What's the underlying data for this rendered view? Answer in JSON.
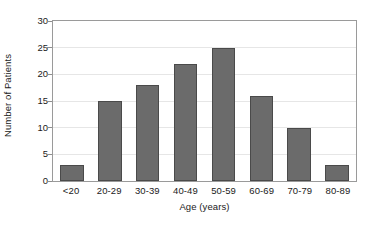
{
  "chart_data": {
    "type": "bar",
    "title": "",
    "xlabel": "Age (years)",
    "ylabel": "Number of Patients",
    "categories": [
      "<20",
      "20-29",
      "30-39",
      "40-49",
      "50-59",
      "60-69",
      "70-79",
      "80-89"
    ],
    "values": [
      3,
      15,
      18,
      22,
      25,
      16,
      10,
      3
    ],
    "ylim": [
      0,
      30
    ],
    "yticks": [
      0,
      5,
      10,
      15,
      20,
      25,
      30
    ],
    "ytick_labels": [
      "0",
      "5",
      "10",
      "15",
      "20",
      "25",
      "30"
    ],
    "grid": "horizontal",
    "legend": "none",
    "orientation": "vertical",
    "series": [
      {
        "name": "Number of Patients",
        "values": [
          3,
          15,
          18,
          22,
          25,
          16,
          10,
          3
        ]
      }
    ],
    "colors": {
      "bar_fill": "#6b6b6b",
      "bar_border": "#4a4a4a",
      "gridline": "#e6e6e6",
      "axis": "#9a9a9a",
      "text": "#1a1a1a",
      "background": "#ffffff"
    }
  }
}
